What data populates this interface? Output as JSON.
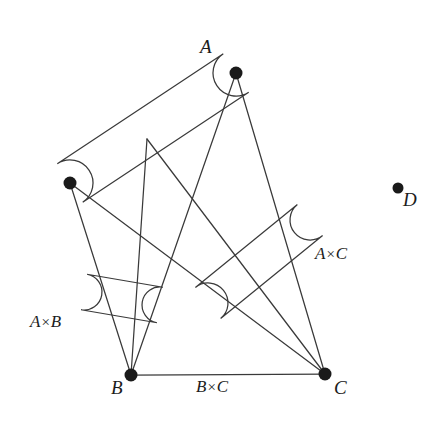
{
  "figure": {
    "type": "graph-diagram",
    "background_color": "#ffffff",
    "stroke_color": "#3a3a3a",
    "vertex_color": "#1a1a1a",
    "vertex_labels": {
      "a": "A",
      "b": "B",
      "c": "C",
      "d": "D"
    },
    "edge_labels": {
      "ab": "A×B",
      "ac": "A×C",
      "bc": "B×C"
    },
    "edge_label_parts": {
      "ab_left": "A",
      "ab_op": "×",
      "ab_right": "B",
      "ac_left": "A",
      "ac_op": "×",
      "ac_right": "C",
      "bc_left": "B",
      "bc_op": "×",
      "bc_right": "C"
    },
    "vertices": [
      {
        "name": "a-top",
        "label": "A",
        "x": 236,
        "y": 73,
        "r": 6.5
      },
      {
        "name": "a-left",
        "label": "",
        "x": 70,
        "y": 183,
        "r": 6.5
      },
      {
        "name": "b",
        "label": "B",
        "x": 131,
        "y": 375,
        "r": 6.5
      },
      {
        "name": "c",
        "label": "C",
        "x": 325,
        "y": 374,
        "r": 6.5
      },
      {
        "name": "d",
        "label": "D",
        "x": 398,
        "y": 188,
        "r": 5.5
      }
    ],
    "capsules": [
      {
        "name": "capsule-a",
        "x1": 70,
        "y1": 183,
        "x2": 236,
        "y2": 73,
        "r": 23
      },
      {
        "name": "capsule-ab",
        "x1": 84,
        "y1": 292,
        "x2": 160,
        "y2": 305,
        "r": 18
      },
      {
        "name": "capsule-ac",
        "x1": 208,
        "y1": 303,
        "x2": 310,
        "y2": 220,
        "r": 20
      }
    ],
    "edges": [
      {
        "name": "edge-a-top-to-b",
        "x1": 236,
        "y1": 73,
        "x2": 131,
        "y2": 375
      },
      {
        "name": "edge-a-top-to-c",
        "x1": 236,
        "y1": 73,
        "x2": 325,
        "y2": 374
      },
      {
        "name": "edge-a-left-to-b",
        "x1": 70,
        "y1": 183,
        "x2": 131,
        "y2": 375
      },
      {
        "name": "edge-a-left-to-c",
        "x1": 70,
        "y1": 183,
        "x2": 325,
        "y2": 374
      },
      {
        "name": "edge-mid-to-b",
        "x1": 147,
        "y1": 139,
        "x2": 131,
        "y2": 375
      },
      {
        "name": "edge-mid-to-c",
        "x1": 147,
        "y1": 139,
        "x2": 325,
        "y2": 374
      },
      {
        "name": "edge-b-to-c",
        "x1": 131,
        "y1": 375,
        "x2": 325,
        "y2": 374
      }
    ],
    "label_positions": [
      {
        "name": "label-a",
        "text": "A",
        "x": 200,
        "y": 37
      },
      {
        "name": "label-b",
        "text": "B",
        "x": 111,
        "y": 378
      },
      {
        "name": "label-c",
        "text": "C",
        "x": 334,
        "y": 378
      },
      {
        "name": "label-d",
        "text": "D",
        "x": 403,
        "y": 190
      },
      {
        "name": "label-ab",
        "text": "A×B",
        "x": 30,
        "y": 313
      },
      {
        "name": "label-ac",
        "text": "A×C",
        "x": 315,
        "y": 245
      },
      {
        "name": "label-bc",
        "text": "B×C",
        "x": 196,
        "y": 378
      }
    ]
  }
}
